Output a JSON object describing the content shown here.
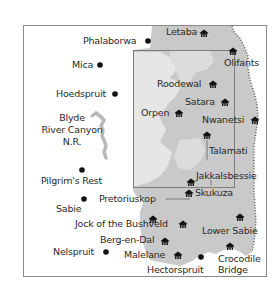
{
  "map": {
    "colors": {
      "background": "#ffffff",
      "frame": "#8a8a8a",
      "park_fill": "#c9c9c9",
      "park_light": "#dcdcdc",
      "park_lighter": "#e6e6e6",
      "river": "#b8b8b8",
      "text": "#2a2a2a",
      "marker": "#111111"
    },
    "towns": [
      {
        "name": "Phalaborwa",
        "x": 148,
        "y": 41
      },
      {
        "name": "Mica",
        "x": 100,
        "y": 66
      },
      {
        "name": "Hoedspruit",
        "x": 115,
        "y": 95
      },
      {
        "name": "Pilgrim's Rest",
        "x": 82,
        "y": 170
      },
      {
        "name": "Sabie",
        "x": 84,
        "y": 199
      },
      {
        "name": "Nelspruit",
        "x": 106,
        "y": 252
      },
      {
        "name": "Hectorspruit",
        "x": 201,
        "y": 257
      }
    ],
    "camps": [
      {
        "name": "Letaba",
        "x": 204,
        "y": 32
      },
      {
        "name": "Olifants",
        "x": 233,
        "y": 50
      },
      {
        "name": "Roodewal",
        "x": 211,
        "y": 84
      },
      {
        "name": "Satara",
        "x": 225,
        "y": 102
      },
      {
        "name": "Orpen",
        "x": 179,
        "y": 113
      },
      {
        "name": "Nwanetsi",
        "x": 255,
        "y": 120
      },
      {
        "name": "Talamati",
        "x": 207,
        "y": 135
      },
      {
        "name": "Jakkalsbessie",
        "x": 191,
        "y": 182
      },
      {
        "name": "Skukuza",
        "x": 189,
        "y": 193
      },
      {
        "name": "Pretoriuskop",
        "x": 153,
        "y": 219
      },
      {
        "name": "Jock of the Bushveld",
        "x": 183,
        "y": 224
      },
      {
        "name": "Lower Sabie",
        "x": 240,
        "y": 217
      },
      {
        "name": "Berg-en-Dal",
        "x": 165,
        "y": 241
      },
      {
        "name": "Malelane",
        "x": 178,
        "y": 255
      },
      {
        "name": "Crocodile Bridge",
        "x": 230,
        "y": 246
      }
    ],
    "regions": [
      {
        "name": "Blyde River Canyon N.R.",
        "lines": [
          "Blyde",
          "River Canyon",
          "N.R."
        ]
      }
    ],
    "labels": {
      "phalaborwa": "Phalaborwa",
      "mica": "Mica",
      "hoedspruit": "Hoedspruit",
      "blyde_1": "Blyde",
      "blyde_2": "River Canyon",
      "blyde_3": "N.R.",
      "pilgrims_rest": "Pilgrim's Rest",
      "sabie": "Sabie",
      "nelspruit": "Nelspruit",
      "hectorspruit": "Hectorspruit",
      "letaba": "Letaba",
      "olifants": "Olifants",
      "roodewal": "Roodewal",
      "satara": "Satara",
      "orpen": "Orpen",
      "nwanetsi": "Nwanetsi",
      "talamati": "Talamati",
      "jakkalsbessie": "Jakkalsbessie",
      "skukuza": "Skukuza",
      "pretoriuskop": "Pretoriuskop",
      "jock": "Jock of the Bushveld",
      "lower_sabie": "Lower Sabie",
      "berg_en_dal": "Berg-en-Dal",
      "malelane": "Malelane",
      "crocodile_1": "Crocodile",
      "crocodile_2": "Bridge"
    }
  }
}
